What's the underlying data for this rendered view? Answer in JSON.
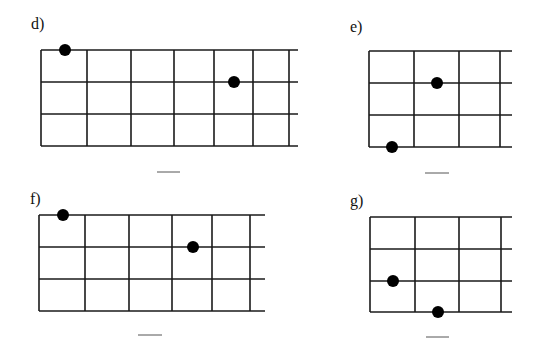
{
  "colors": {
    "line": "#1a1a1a",
    "dot": "#000000",
    "background": "#ffffff"
  },
  "diagrams": [
    {
      "label": "d)",
      "label_pos": [
        31,
        16
      ],
      "left": 41,
      "right": 298,
      "rows_y": [
        50,
        82,
        114,
        146
      ],
      "cols_x": [
        41,
        87,
        131,
        174,
        214,
        253,
        289
      ],
      "dots": [
        [
          65,
          50
        ],
        [
          234,
          82
        ]
      ],
      "blank": [
        157,
        180,
        172
      ]
    },
    {
      "label": "e)",
      "label_pos": [
        350,
        19
      ],
      "left": 369,
      "right": 512,
      "rows_y": [
        51,
        83,
        115,
        147
      ],
      "cols_x": [
        369,
        414,
        459,
        500
      ],
      "dots": [
        [
          437,
          83
        ],
        [
          392,
          147
        ]
      ],
      "blank": [
        425,
        449,
        173
      ]
    },
    {
      "label": "f)",
      "label_pos": [
        30,
        191
      ],
      "left": 39,
      "right": 265,
      "rows_y": [
        215,
        247,
        279,
        311
      ],
      "cols_x": [
        39,
        85,
        129,
        172,
        212,
        250
      ],
      "dots": [
        [
          63,
          215
        ],
        [
          193,
          247
        ]
      ],
      "blank": [
        138,
        162,
        335
      ]
    },
    {
      "label": "g)",
      "label_pos": [
        350,
        193
      ],
      "left": 370,
      "right": 512,
      "rows_y": [
        217,
        249,
        281,
        312
      ],
      "cols_x": [
        370,
        415,
        459,
        501
      ],
      "dots": [
        [
          393,
          281
        ],
        [
          438,
          312
        ]
      ],
      "blank": [
        426,
        449,
        337
      ]
    }
  ]
}
